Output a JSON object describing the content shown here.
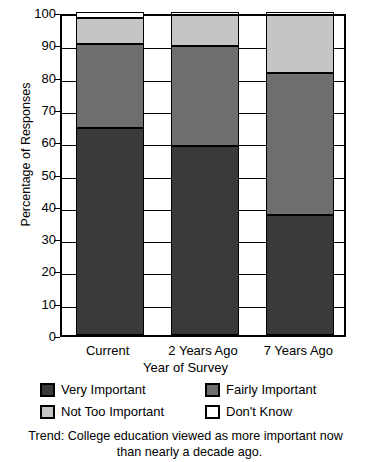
{
  "chart_data": {
    "type": "bar",
    "subtype": "stacked-vertical-100",
    "title": "",
    "xlabel": "Year of Survey",
    "ylabel": "Percentage of Responses",
    "ylim": [
      0,
      100
    ],
    "yticks": [
      0,
      10,
      20,
      30,
      40,
      50,
      60,
      70,
      80,
      90,
      100
    ],
    "ytick_labels": [
      "0",
      "10",
      "20",
      "30",
      "40",
      "50",
      "60",
      "70",
      "80",
      "90",
      "100"
    ],
    "grid": true,
    "grid_axis": "y",
    "legend_position": "below-axes",
    "categories": [
      "Current",
      "2 Years Ago",
      "7 Years Ago"
    ],
    "series": [
      {
        "name": "Very Important",
        "color": "#3a3a3a",
        "values": [
          64,
          58.5,
          37
        ]
      },
      {
        "name": "Fairly Important",
        "color": "#6e6e6e",
        "values": [
          26,
          31,
          44
        ]
      },
      {
        "name": "Not Too Important",
        "color": "#c5c5c5",
        "values": [
          8,
          9.5,
          18
        ]
      },
      {
        "name": "Don't Know",
        "color": "#ffffff",
        "values": [
          2,
          1,
          1
        ]
      }
    ],
    "cumulative_tops": {
      "Current": [
        64,
        90,
        98,
        100
      ],
      "2 Years Ago": [
        58.5,
        89.5,
        99,
        100
      ],
      "7 Years Ago": [
        37,
        81,
        99,
        100
      ]
    },
    "annotations": [
      "Trend: College education viewed as more important now than nearly a decade ago."
    ]
  },
  "axes": {
    "y_title": "Percentage of Responses",
    "x_title": "Year of Survey",
    "y_tick_labels": [
      "100",
      "90",
      "80",
      "70",
      "60",
      "50",
      "40",
      "30",
      "20",
      "10",
      "0"
    ],
    "x_tick_labels": [
      "Current",
      "2 Years Ago",
      "7 Years Ago"
    ]
  },
  "legend": {
    "items": [
      {
        "label": "Very Important",
        "color": "#3a3a3a"
      },
      {
        "label": "Fairly Important",
        "color": "#6e6e6e"
      },
      {
        "label": "Not Too Important",
        "color": "#c5c5c5"
      },
      {
        "label": "Don't Know",
        "color": "#ffffff"
      }
    ]
  },
  "caption": {
    "line1": "Trend: College education viewed as more important now",
    "line2": "than nearly a decade ago."
  },
  "colors": {
    "very_important": "#3a3a3a",
    "fairly_important": "#6e6e6e",
    "not_too_important": "#c5c5c5",
    "dont_know": "#ffffff",
    "axis": "#000000",
    "background": "#ffffff"
  }
}
